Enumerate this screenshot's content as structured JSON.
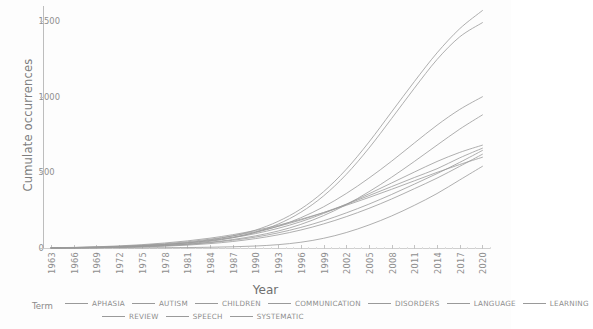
{
  "chart_data": {
    "type": "line",
    "title": "",
    "xlabel": "Year",
    "ylabel": "Cumulate occurrences",
    "legend_title": "Term",
    "legend_position": "bottom",
    "grid": false,
    "xlim": [
      1962,
      2021
    ],
    "ylim": [
      0,
      1600
    ],
    "yticks": [
      "0",
      "500",
      "1000",
      "1500"
    ],
    "ytick_values": [
      0,
      500,
      1000,
      1500
    ],
    "xticks": [
      "1963",
      "1966",
      "1969",
      "1972",
      "1975",
      "1978",
      "1981",
      "1984",
      "1987",
      "1990",
      "1993",
      "1996",
      "1999",
      "2002",
      "2005",
      "2008",
      "2011",
      "2014",
      "2017",
      "2020"
    ],
    "x": [
      1963,
      1966,
      1969,
      1972,
      1975,
      1978,
      1981,
      1984,
      1987,
      1990,
      1993,
      1996,
      1999,
      2002,
      2005,
      2008,
      2011,
      2014,
      2017,
      2020
    ],
    "series": [
      {
        "name": "APHASIA",
        "final_value": 1570,
        "values": [
          1,
          3,
          6,
          10,
          16,
          24,
          36,
          54,
          80,
          118,
          176,
          258,
          372,
          520,
          700,
          900,
          1100,
          1290,
          1450,
          1570
        ]
      },
      {
        "name": "AUTISM",
        "final_value": 1490,
        "values": [
          0,
          1,
          3,
          6,
          11,
          18,
          28,
          44,
          68,
          104,
          158,
          236,
          344,
          486,
          660,
          856,
          1056,
          1246,
          1396,
          1490
        ]
      },
      {
        "name": "CHILDREN",
        "final_value": 1000,
        "values": [
          1,
          2,
          5,
          9,
          15,
          23,
          34,
          50,
          72,
          102,
          144,
          200,
          272,
          360,
          462,
          574,
          694,
          812,
          916,
          1000
        ]
      },
      {
        "name": "COMMUNICATION",
        "final_value": 880,
        "values": [
          0,
          1,
          3,
          6,
          10,
          16,
          25,
          38,
          56,
          80,
          112,
          156,
          214,
          286,
          372,
          468,
          572,
          680,
          786,
          880
        ]
      },
      {
        "name": "DISORDERS",
        "final_value": 680,
        "values": [
          1,
          2,
          4,
          8,
          14,
          22,
          33,
          48,
          68,
          95,
          130,
          174,
          228,
          290,
          358,
          430,
          502,
          572,
          632,
          680
        ]
      },
      {
        "name": "LANGUAGE",
        "final_value": 660,
        "values": [
          1,
          3,
          6,
          11,
          18,
          28,
          41,
          58,
          80,
          108,
          143,
          185,
          234,
          288,
          346,
          406,
          466,
          524,
          596,
          660
        ]
      },
      {
        "name": "LEARNING",
        "final_value": 645,
        "values": [
          0,
          1,
          2,
          5,
          9,
          15,
          23,
          35,
          51,
          72,
          100,
          136,
          180,
          232,
          290,
          354,
          422,
          492,
          566,
          645
        ]
      },
      {
        "name": "REVIEW",
        "final_value": 620,
        "values": [
          0,
          1,
          2,
          4,
          7,
          12,
          19,
          29,
          43,
          62,
          87,
          119,
          159,
          207,
          262,
          324,
          392,
          462,
          540,
          620
        ]
      },
      {
        "name": "SPEECH",
        "final_value": 600,
        "values": [
          2,
          4,
          8,
          14,
          22,
          33,
          47,
          65,
          88,
          116,
          150,
          190,
          234,
          282,
          334,
          388,
          444,
          500,
          552,
          600
        ]
      },
      {
        "name": "SYSTEMATIC",
        "final_value": 540,
        "values": [
          0,
          0,
          0,
          1,
          1,
          2,
          3,
          5,
          8,
          13,
          22,
          38,
          64,
          102,
          152,
          212,
          282,
          360,
          450,
          540
        ]
      }
    ],
    "legend_rows": [
      [
        "APHASIA",
        "AUTISM",
        "CHILDREN",
        "COMMUNICATION",
        "DISORDERS",
        "LANGUAGE",
        "LEARNING"
      ],
      [
        "REVIEW",
        "SPEECH",
        "SYSTEMATIC"
      ]
    ],
    "line_color": "#9a9a9a",
    "axis_color": "#bdbdbd",
    "text_color": "#8c8c8c"
  }
}
